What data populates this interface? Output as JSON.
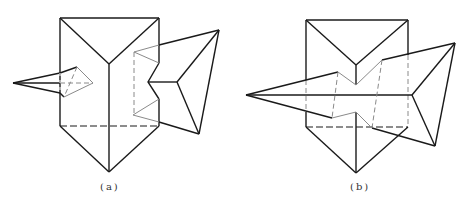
{
  "figure": {
    "panels": [
      {
        "id": "a",
        "caption": "(a)"
      },
      {
        "id": "b",
        "caption": "(b)"
      }
    ]
  },
  "colors": {
    "visible_line": "#1a1a1a",
    "hidden_line": "#8a8a8a",
    "background": "#ffffff"
  }
}
